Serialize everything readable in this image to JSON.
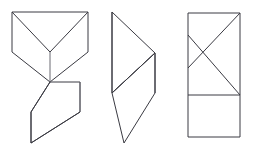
{
  "page": {
    "background_color": "#ffffff",
    "width": 253,
    "height": 152
  },
  "style": {
    "stroke_color": "#3a3a42",
    "stroke_color_soft": "#6b6b73",
    "fill_color": "#ffffff",
    "stroke_width": 1
  },
  "figures": [
    {
      "id": "figure-1",
      "name": "arrow-chevron-with-parallelogram",
      "description": "Rectangle with two diagonals converging to a lower-center point, chevron sides descending to a V tip, with a parallelogram extending below",
      "parts": [
        {
          "name": "upper-rectangle-outline",
          "type": "polygon",
          "points": "12,12 88,12 88,52 50,52 12,52"
        },
        {
          "name": "chevron-body",
          "type": "polygon",
          "points": "12,52 50,82 88,52 88,52"
        },
        {
          "name": "left-diagonal",
          "type": "line",
          "points": "12,12 50,52"
        },
        {
          "name": "right-diagonal",
          "type": "line",
          "points": "88,12 50,52"
        },
        {
          "name": "center-vertical",
          "type": "line",
          "points": "50,52 50,82"
        },
        {
          "name": "lower-parallelogram",
          "type": "polygon",
          "points": "50,82 80,82 80,112 31,143 31,112"
        }
      ]
    },
    {
      "id": "figure-2",
      "name": "triangle-over-parallelogram",
      "description": "Right-pointing triangle on top joined to a parallelogram below, sharing a diagonal edge",
      "parts": [
        {
          "name": "upper-triangle",
          "type": "polygon",
          "points": "112,12 155,53 112,93"
        },
        {
          "name": "lower-parallelogram",
          "type": "polygon",
          "points": "112,93 155,53 155,93 124,143"
        },
        {
          "name": "shared-diagonal",
          "type": "line",
          "points": "112,93 155,53"
        }
      ]
    },
    {
      "id": "figure-3",
      "name": "rectangle-with-crossing-diagonals",
      "description": "Tall rectangle split by a horizontal line, upper half containing two crossing diagonal lines",
      "parts": [
        {
          "name": "outer-rectangle",
          "type": "polygon",
          "points": "188,13 240,13 240,137 188,137"
        },
        {
          "name": "horizontal-divider",
          "type": "line",
          "points": "188,95 240,95"
        },
        {
          "name": "long-diagonal",
          "type": "line",
          "points": "240,13 188,68"
        },
        {
          "name": "crossing-diagonal",
          "type": "line",
          "points": "188,35 240,95"
        },
        {
          "name": "short-right-edge-segment",
          "type": "line",
          "points": "240,13 240,68"
        }
      ]
    }
  ]
}
